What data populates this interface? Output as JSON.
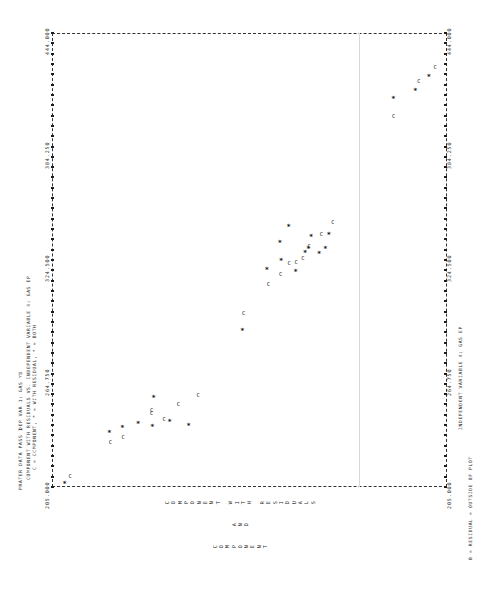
{
  "figure": {
    "kind": "lineprinter-scatter",
    "orientation": "landscape-rotated-90",
    "header_line1": "PRATER DATA PASS 1",
    "header_line2": "DEP VAR 1: GAS YD",
    "title_line1": "COMPONENT WITH RESIDUALS VS. INDEPENDENT VARIABLE 4: GAS EP",
    "title_line2": "C = CCMPONENT, * = WITH RESIDUAL, * = BOTH",
    "xaxis_label": "INDEPENDENT VARIABLE 4: GAS EP",
    "footnote": "0 = RESIDUAL = OUTSIDE OF PLOT",
    "ylabel_line1": "COMPONENT WITH RESIDUALS",
    "ylabel_line2": "AND",
    "ylabel_line3": "COMPONENT",
    "legend": [
      {
        "symbol": "C",
        "meaning": "CCMPONENT"
      },
      {
        "symbol": "*",
        "meaning": "WITH RESIDUAL"
      },
      {
        "symbol": "*",
        "meaning": "BOTH"
      }
    ]
  },
  "chart_data": {
    "type": "scatter",
    "title": "COMPONENT WITH RESIDUALS VS. INDEPENDENT VARIABLE 4: GAS EP",
    "xlabel": "INDEPENDENT VARIABLE 4: GAS EP",
    "ylabel": "COMPONENT WITH RESIDUALS AND COMPONENT",
    "grid": false,
    "legend_position": "subtitle",
    "xlim": [
      205.0,
      444.0
    ],
    "xticks": [
      205.0,
      264.75,
      324.5,
      384.25,
      444.0
    ],
    "xticklabels": [
      "205.000",
      "264.750",
      "324.500",
      "384.250",
      "444.000"
    ],
    "ylim": [
      0,
      100
    ],
    "yticks": [],
    "yticklabels": [],
    "series": [
      {
        "name": "C",
        "marker": "C",
        "meaning": "CCMPONENT",
        "points": [
          [
            210.3,
            95.4
          ],
          [
            227.9,
            85.2
          ],
          [
            230.8,
            82.0
          ],
          [
            243.5,
            74.8
          ],
          [
            244.9,
            74.8
          ],
          [
            240.4,
            71.6
          ],
          [
            248.4,
            68.0
          ],
          [
            252.9,
            63.0
          ],
          [
            296.0,
            51.5
          ],
          [
            311.5,
            45.2
          ],
          [
            316.8,
            42.1
          ],
          [
            322.6,
            40.0
          ],
          [
            322.9,
            38.2
          ],
          [
            325.2,
            36.5
          ],
          [
            331.5,
            34.9
          ],
          [
            337.8,
            31.8
          ],
          [
            343.9,
            28.9
          ],
          [
            400.0,
            13.5
          ],
          [
            418.2,
            7.1
          ],
          [
            425.4,
            3.0
          ]
        ]
      },
      {
        "name": "*",
        "marker": "*",
        "meaning": "WITH RESIDUAL / BOTH",
        "points": [
          [
            206.6,
            96.8
          ],
          [
            233.6,
            85.5
          ],
          [
            236.2,
            82.2
          ],
          [
            238.0,
            78.2
          ],
          [
            236.6,
            74.6
          ],
          [
            252.0,
            74.3
          ],
          [
            239.1,
            70.2
          ],
          [
            237.2,
            65.4
          ],
          [
            287.3,
            51.8
          ],
          [
            319.1,
            45.6
          ],
          [
            324.0,
            42.0
          ],
          [
            333.5,
            42.3
          ],
          [
            342.1,
            40.1
          ],
          [
            318.3,
            38.3
          ],
          [
            328.0,
            35.9
          ],
          [
            330.3,
            35.1
          ],
          [
            336.8,
            34.4
          ],
          [
            327.5,
            32.4
          ],
          [
            330.5,
            30.8
          ],
          [
            337.5,
            29.9
          ],
          [
            409.0,
            13.6
          ],
          [
            413.3,
            8.0
          ],
          [
            420.8,
            4.6
          ]
        ]
      }
    ]
  }
}
